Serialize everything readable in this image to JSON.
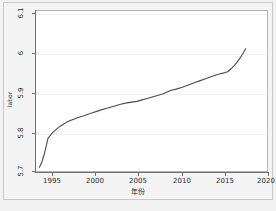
{
  "chart_data": {
    "type": "line",
    "title": "",
    "xlabel": "年份",
    "ylabel": "labor",
    "xlim": [
      1993.6,
      2020.6
    ],
    "ylim": [
      5.7,
      6.132
    ],
    "grid": true,
    "legend": "none",
    "xticks": [
      "1995",
      "2000",
      "2005",
      "2010",
      "2015",
      "2020"
    ],
    "xtick_values": [
      1995,
      2000,
      2005,
      2010,
      2015,
      2020
    ],
    "yticks": [
      "5.7",
      "5.8",
      "5.9",
      "6",
      "6.1"
    ],
    "ytick_values": [
      5.7,
      5.8,
      5.9,
      6.0,
      6.1
    ],
    "line_color": "#4a4a4a",
    "series": [
      {
        "name": "labor",
        "x": [
          1994.0,
          1994.3,
          1994.6,
          1995.0,
          1995.4,
          1995.8,
          1996.2,
          1996.7,
          1997.2,
          1997.7,
          1998.2,
          1998.7,
          1999.2,
          1999.7,
          2000.2,
          2000.7,
          2001.2,
          2001.8,
          2002.4,
          2003.0,
          2003.6,
          2004.2,
          2004.8,
          2005.4,
          2006.0,
          2006.6,
          2007.2,
          2007.8,
          2008.4,
          2009.0,
          2009.4,
          2010.0,
          2010.7,
          2011.4,
          2012.1,
          2012.8,
          2013.5,
          2014.2,
          2014.9,
          2015.6,
          2016.0,
          2016.4,
          2016.9,
          2017.3,
          2017.7,
          2018.1
        ],
        "y": [
          5.71,
          5.725,
          5.748,
          5.788,
          5.8,
          5.809,
          5.817,
          5.825,
          5.832,
          5.837,
          5.842,
          5.846,
          5.849,
          5.853,
          5.857,
          5.861,
          5.865,
          5.869,
          5.873,
          5.877,
          5.881,
          5.884,
          5.886,
          5.888,
          5.892,
          5.896,
          5.9,
          5.904,
          5.908,
          5.914,
          5.918,
          5.921,
          5.926,
          5.932,
          5.938,
          5.944,
          5.95,
          5.956,
          5.961,
          5.965,
          5.968,
          5.976,
          5.988,
          6.0,
          6.014,
          6.03
        ]
      }
    ]
  },
  "figure": {
    "y_axis_title": "labor",
    "x_axis_title": "年份",
    "y_tick_labels": [
      "6.1",
      "6",
      "5.9",
      "5.8",
      "5.7"
    ],
    "x_tick_labels": [
      "1995",
      "2000",
      "2005",
      "2010",
      "2015",
      "2020"
    ]
  }
}
